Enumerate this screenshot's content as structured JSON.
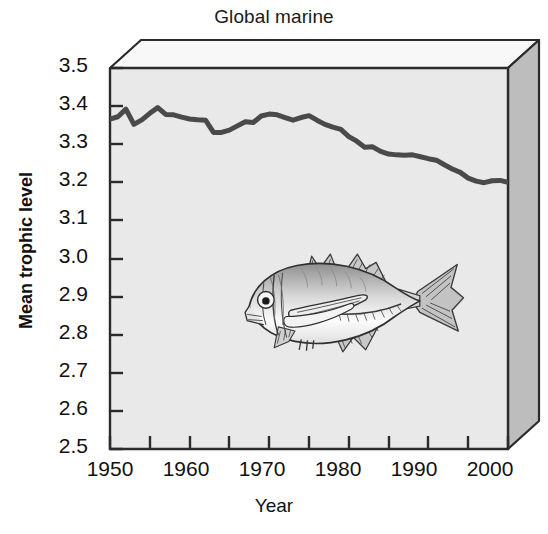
{
  "chart_data": {
    "type": "line",
    "title": "Global marine",
    "xlabel": "Year",
    "ylabel": "Mean trophic level",
    "xlim": [
      1950,
      2000
    ],
    "ylim": [
      2.5,
      3.5
    ],
    "grid": false,
    "legend": null,
    "y_ticks": [
      "3.5",
      "3.4",
      "3.3",
      "3.2",
      "3.1",
      "3.0",
      "2.9",
      "2.8",
      "2.7",
      "2.6",
      "2.5"
    ],
    "y_tick_values": [
      3.5,
      3.4,
      3.3,
      3.2,
      3.1,
      3.0,
      2.9,
      2.8,
      2.7,
      2.6,
      2.5
    ],
    "x_ticks": [
      "1950",
      "1960",
      "1970",
      "1980",
      "1990",
      "2000"
    ],
    "x_tick_values": [
      1950,
      1960,
      1970,
      1980,
      1990,
      2000
    ],
    "x_minor_tick_values": [
      1955,
      1965,
      1975,
      1985,
      1995
    ],
    "line_color": "#4a4a4a",
    "line_width": 5,
    "plot_background": "#e8e8e8",
    "series": [
      {
        "name": "Global marine mean trophic level",
        "x": [
          1950,
          1951,
          1952,
          1953,
          1954,
          1955,
          1956,
          1957,
          1958,
          1959,
          1960,
          1961,
          1962,
          1963,
          1964,
          1965,
          1966,
          1967,
          1968,
          1969,
          1970,
          1971,
          1972,
          1973,
          1974,
          1975,
          1976,
          1977,
          1978,
          1979,
          1980,
          1981,
          1982,
          1983,
          1984,
          1985,
          1986,
          1987,
          1988,
          1989,
          1990,
          1991,
          1992,
          1993,
          1994,
          1995,
          1996,
          1997,
          1998,
          1999,
          2000
        ],
        "values": [
          3.366,
          3.372,
          3.392,
          3.352,
          3.364,
          3.381,
          3.396,
          3.378,
          3.377,
          3.371,
          3.366,
          3.364,
          3.363,
          3.331,
          3.331,
          3.337,
          3.348,
          3.359,
          3.357,
          3.374,
          3.379,
          3.377,
          3.37,
          3.363,
          3.37,
          3.375,
          3.363,
          3.352,
          3.345,
          3.339,
          3.32,
          3.308,
          3.292,
          3.293,
          3.281,
          3.274,
          3.272,
          3.271,
          3.272,
          3.267,
          3.262,
          3.258,
          3.246,
          3.235,
          3.226,
          3.211,
          3.203,
          3.199,
          3.204,
          3.205,
          3.2
        ]
      }
    ],
    "annotations": [
      {
        "name": "fish-illustration",
        "description": "Pencil-style grayscale drawing of a jack / trevally fish facing left",
        "x_range": [
          1972,
          1995
        ],
        "y_range": [
          2.76,
          3.02
        ]
      }
    ]
  },
  "figure": {
    "style": "3d-boxed-plot",
    "box_top_face_color": "#f7f7f7",
    "box_right_face_color": "#b9b9b9",
    "frame_color": "#2b2b2b"
  }
}
